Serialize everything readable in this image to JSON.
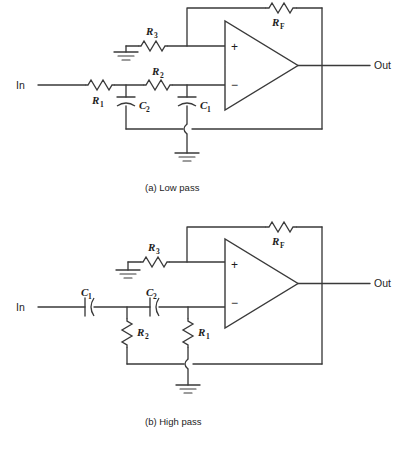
{
  "figure": {
    "background_color": "#ffffff",
    "line_color": "#3a3a3a",
    "text_color": "#1d1d1d"
  },
  "circuits": [
    {
      "id": "low-pass",
      "caption": "(a)  Low pass",
      "input_label": "In",
      "output_label": "Out",
      "opamp": {
        "plus": "+",
        "minus": "−"
      },
      "components": [
        {
          "name": "R1",
          "letter": "R",
          "sub": "1",
          "type": "resistor",
          "orientation": "horizontal"
        },
        {
          "name": "R2",
          "letter": "R",
          "sub": "2",
          "type": "resistor",
          "orientation": "horizontal"
        },
        {
          "name": "R3",
          "letter": "R",
          "sub": "3",
          "type": "resistor",
          "orientation": "horizontal"
        },
        {
          "name": "RF",
          "letter": "R",
          "sub": "F",
          "type": "resistor",
          "orientation": "horizontal"
        },
        {
          "name": "C1",
          "letter": "C",
          "sub": "1",
          "type": "capacitor",
          "orientation": "vertical"
        },
        {
          "name": "C2",
          "letter": "C",
          "sub": "2",
          "type": "capacitor",
          "orientation": "vertical"
        }
      ],
      "grounds": 2
    },
    {
      "id": "high-pass",
      "caption": "(b)  High pass",
      "input_label": "In",
      "output_label": "Out",
      "opamp": {
        "plus": "+",
        "minus": "−"
      },
      "components": [
        {
          "name": "C1",
          "letter": "C",
          "sub": "1",
          "type": "capacitor",
          "orientation": "horizontal"
        },
        {
          "name": "C2",
          "letter": "C",
          "sub": "2",
          "type": "capacitor",
          "orientation": "horizontal"
        },
        {
          "name": "R1",
          "letter": "R",
          "sub": "1",
          "type": "resistor",
          "orientation": "vertical"
        },
        {
          "name": "R2",
          "letter": "R",
          "sub": "2",
          "type": "resistor",
          "orientation": "vertical"
        },
        {
          "name": "R3",
          "letter": "R",
          "sub": "3",
          "type": "resistor",
          "orientation": "horizontal"
        },
        {
          "name": "RF",
          "letter": "R",
          "sub": "F",
          "type": "resistor",
          "orientation": "horizontal"
        }
      ],
      "grounds": 2
    }
  ],
  "labels": {
    "a_R3": {
      "letter": "R",
      "sub": "3"
    },
    "a_R2": {
      "letter": "R",
      "sub": "2"
    },
    "a_R1": {
      "letter": "R",
      "sub": "1"
    },
    "a_RF": {
      "letter": "R",
      "sub": "F"
    },
    "a_C1": {
      "letter": "C",
      "sub": "1"
    },
    "a_C2": {
      "letter": "C",
      "sub": "2"
    },
    "b_R3": {
      "letter": "R",
      "sub": "3"
    },
    "b_RF": {
      "letter": "R",
      "sub": "F"
    },
    "b_R1": {
      "letter": "R",
      "sub": "1"
    },
    "b_R2": {
      "letter": "R",
      "sub": "2"
    },
    "b_C1": {
      "letter": "C",
      "sub": "1"
    },
    "b_C2": {
      "letter": "C",
      "sub": "2"
    }
  }
}
